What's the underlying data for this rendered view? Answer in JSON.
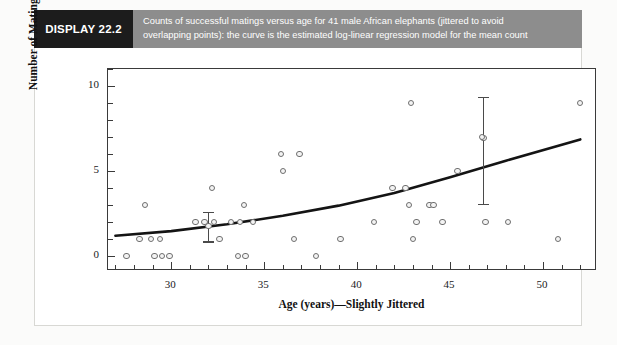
{
  "banner": {
    "tag": "DISPLAY 22.2",
    "caption_line1": "Counts of successful matings versus age for 41 male African elephants (jittered to avoid",
    "caption_line2": "overlapping points): the curve is the estimated log-linear regression model for the mean count",
    "tag_bg": "#1c1c1c",
    "caption_bg": "#8d8d8d"
  },
  "chart_data": {
    "type": "scatter",
    "title": "Counts of successful matings versus age for 41 male African elephants (jittered to avoid overlapping points): the curve is the estimated log-linear regression model for the mean count",
    "xlabel": "Age (years)—Slightly Jittered",
    "ylabel": "Number of Matings",
    "xlim": [
      26.6,
      52.9
    ],
    "ylim": [
      -0.9,
      11.0
    ],
    "xticks_major": [
      30,
      35,
      40,
      45,
      50
    ],
    "xticks_major_labels": [
      "30",
      "35",
      "40",
      "45",
      "50"
    ],
    "xticks_minor_step": 1,
    "yticks_major": [
      0,
      5,
      10
    ],
    "yticks_major_labels": [
      "0",
      "5",
      "10"
    ],
    "yticks_minor_step": 1,
    "grid": false,
    "legend": "none",
    "n_points": 41,
    "points": [
      {
        "x": 27.6,
        "y": 0
      },
      {
        "x": 28.3,
        "y": 1
      },
      {
        "x": 28.9,
        "y": 1
      },
      {
        "x": 29.4,
        "y": 1
      },
      {
        "x": 29.1,
        "y": 0
      },
      {
        "x": 29.5,
        "y": 0
      },
      {
        "x": 29.9,
        "y": 0
      },
      {
        "x": 28.6,
        "y": 3
      },
      {
        "x": 31.3,
        "y": 2
      },
      {
        "x": 31.8,
        "y": 2
      },
      {
        "x": 32.3,
        "y": 2
      },
      {
        "x": 32.2,
        "y": 4
      },
      {
        "x": 32.6,
        "y": 1
      },
      {
        "x": 33.2,
        "y": 2
      },
      {
        "x": 33.6,
        "y": 0
      },
      {
        "x": 34.0,
        "y": 0
      },
      {
        "x": 33.7,
        "y": 2
      },
      {
        "x": 33.9,
        "y": 3
      },
      {
        "x": 34.4,
        "y": 2
      },
      {
        "x": 35.9,
        "y": 6
      },
      {
        "x": 36.9,
        "y": 6
      },
      {
        "x": 36.0,
        "y": 5
      },
      {
        "x": 36.6,
        "y": 1
      },
      {
        "x": 37.8,
        "y": 0
      },
      {
        "x": 39.1,
        "y": 1
      },
      {
        "x": 40.9,
        "y": 2
      },
      {
        "x": 41.9,
        "y": 4
      },
      {
        "x": 42.9,
        "y": 9
      },
      {
        "x": 42.6,
        "y": 4
      },
      {
        "x": 42.8,
        "y": 3
      },
      {
        "x": 43.2,
        "y": 2
      },
      {
        "x": 43.0,
        "y": 1
      },
      {
        "x": 43.9,
        "y": 3
      },
      {
        "x": 44.1,
        "y": 3
      },
      {
        "x": 44.6,
        "y": 2
      },
      {
        "x": 45.4,
        "y": 5
      },
      {
        "x": 46.7,
        "y": 7
      },
      {
        "x": 46.9,
        "y": 2
      },
      {
        "x": 48.1,
        "y": 2
      },
      {
        "x": 52.0,
        "y": 9
      },
      {
        "x": 50.8,
        "y": 1
      }
    ],
    "error_bars": [
      {
        "x": 32.0,
        "y": 1.75,
        "low": 0.85,
        "high": 2.6
      },
      {
        "x": 46.8,
        "y": 6.95,
        "low": 3.05,
        "high": 9.35
      }
    ],
    "curve": {
      "label": "estimated log-linear regression model for the mean count",
      "model": "log-linear",
      "points": [
        {
          "x": 27.0,
          "y": 1.18
        },
        {
          "x": 30.0,
          "y": 1.45
        },
        {
          "x": 33.0,
          "y": 1.85
        },
        {
          "x": 36.0,
          "y": 2.35
        },
        {
          "x": 39.0,
          "y": 2.95
        },
        {
          "x": 42.0,
          "y": 3.7
        },
        {
          "x": 45.0,
          "y": 4.62
        },
        {
          "x": 48.0,
          "y": 5.6
        },
        {
          "x": 52.0,
          "y": 6.85
        }
      ]
    }
  }
}
